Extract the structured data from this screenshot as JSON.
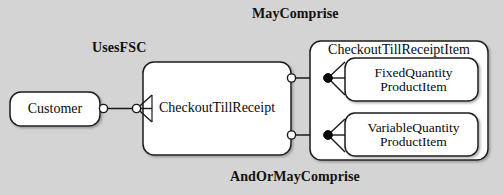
{
  "diagram": {
    "type": "entity-relationship-diagram",
    "background_color": "#d4d4d4",
    "node_fill": "#ffffff",
    "stroke_color": "#1a1a1a",
    "relationship_labels": [
      {
        "id": "uses-fsc",
        "text": "UsesFSC"
      },
      {
        "id": "may-comprise",
        "text": "MayComprise"
      },
      {
        "id": "and-or-may-comprise",
        "text": "AndOrMayComprise"
      }
    ],
    "entities": [
      {
        "id": "customer",
        "text": "Customer"
      },
      {
        "id": "checkout-till-receipt",
        "text": "CheckoutTillReceipt"
      },
      {
        "id": "checkout-till-receipt-item",
        "text": "CheckoutTillReceiptItem"
      },
      {
        "id": "fixed-quantity-product-item",
        "text": "FixedQuantity\nProductItem"
      },
      {
        "id": "variable-quantity-product-item",
        "text": "VariableQuantity\nProductItem"
      }
    ],
    "connectors": [
      {
        "id": "customer-to-receipt",
        "from": "customer",
        "to": "checkout-till-receipt",
        "from_marker": "hollow-circle",
        "to_marker": "hollow-circle-crowsfoot",
        "label": "UsesFSC"
      },
      {
        "id": "receipt-to-fixed-quantity",
        "from": "checkout-till-receipt",
        "to": "fixed-quantity-product-item",
        "from_marker": "hollow-circle",
        "to_marker": "filled-circle-crowsfoot",
        "label": "MayComprise"
      },
      {
        "id": "receipt-to-variable-quantity",
        "from": "checkout-till-receipt",
        "to": "variable-quantity-product-item",
        "from_marker": "hollow-circle",
        "to_marker": "filled-circle-crowsfoot",
        "label": "AndOrMayComprise"
      }
    ]
  }
}
